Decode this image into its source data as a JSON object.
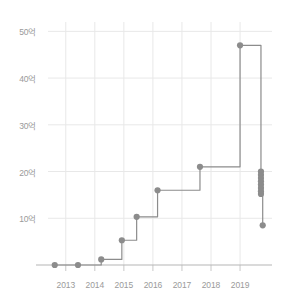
{
  "chart_data": {
    "type": "line",
    "line_style": "step-after",
    "title": "",
    "subtitle": "",
    "xlabel": "",
    "ylabel": "",
    "xlim": [
      2012.25,
      2020.1
    ],
    "ylim": [
      0,
      52
    ],
    "grid": true,
    "grid_axis": "both",
    "legend": false,
    "legend_position": "none",
    "y_tick_values": [
      10,
      20,
      30,
      40,
      50
    ],
    "y_tick_labels": [
      "10억",
      "20억",
      "30억",
      "40억",
      "50억"
    ],
    "x_tick_values": [
      2013,
      2014,
      2015,
      2016,
      2017,
      2018,
      2019
    ],
    "x_tick_labels": [
      "2013",
      "2014",
      "2015",
      "2016",
      "2017",
      "2018",
      "2019"
    ],
    "marker": "circle",
    "series": [
      {
        "name": "누적 투자금액",
        "color": "#8c8c8c",
        "x": [
          2012.62,
          2013.42,
          2014.22,
          2014.93,
          2015.44,
          2016.16,
          2017.62,
          2019.0,
          2019.72,
          2019.72,
          2019.72,
          2019.72,
          2019.72,
          2019.72,
          2019.72,
          2019.72,
          2019.78
        ],
        "values": [
          0.0,
          0.0,
          1.2,
          5.3,
          10.3,
          16.0,
          21.0,
          47.0,
          20.0,
          19.3,
          18.6,
          17.9,
          17.2,
          16.5,
          15.8,
          15.2,
          8.5
        ]
      }
    ],
    "annotations": []
  },
  "axis": {
    "y_axis_name": "y-axis",
    "x_axis_name": "x-axis",
    "grid_color": "#e8e8e8",
    "axis_color": "#b5b5b5",
    "tick_color": "#c8c8c8",
    "label_color": "#9a9a9a"
  },
  "colors": {
    "background": "#ffffff",
    "series": "#8c8c8c",
    "grid": "#e8e8e8"
  }
}
